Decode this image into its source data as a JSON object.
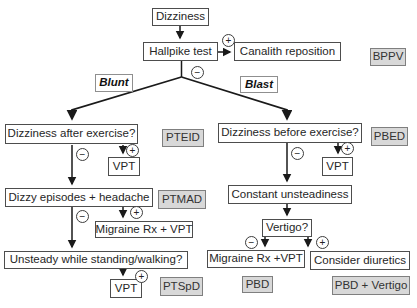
{
  "nodes": {
    "dizziness": "Dizziness",
    "hallpike_test": "Hallpike test",
    "canalith_reposition": "Canalith reposition",
    "blunt": "Blunt",
    "blast": "Blast",
    "dizziness_after_exercise": "Dizziness after exercise?",
    "vpt_left": "VPT",
    "dizzy_episodes_headache": "Dizzy episodes + headache",
    "migraine_rx_vpt_left": "Migraine Rx + VPT",
    "unsteady_standing_walking": "Unsteady while standing/walking?",
    "vpt_bottom": "VPT",
    "dizziness_before_exercise": "Dizziness before exercise?",
    "vpt_right": "VPT",
    "constant_unsteadiness": "Constant unsteadiness",
    "vertigo": "Vertigo?",
    "migraine_rx_vpt_right": "Migraine Rx +VPT",
    "consider_diuretics": "Consider diuretics"
  },
  "tags": {
    "bppv": "BPPV",
    "pteid": "PTEID",
    "ptmad": "PTMAD",
    "ptspd": "PTSpD",
    "pbed": "PBED",
    "pbd": "PBD",
    "pbd_vertigo": "PBD + Vertigo"
  },
  "symbols": {
    "positive": "+",
    "negative": "−"
  },
  "colors": {
    "line": "#1a1a1a",
    "box_border": "#4d4d4d",
    "box_bg": "#ffffff",
    "tag_bg": "#d8d8d8",
    "tag_border": "#7f7f7f",
    "text": "#262626"
  }
}
